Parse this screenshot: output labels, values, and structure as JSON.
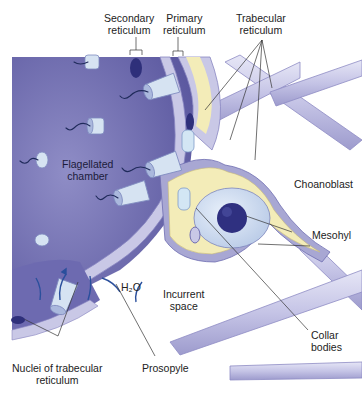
{
  "figure": {
    "colors": {
      "chamber": "#7b79b8",
      "chamber_dark": "#5e5ba3",
      "reticulum": "#c8c8e6",
      "reticulum_edge": "#a6a5d2",
      "mesohyl": "#f3ecb8",
      "nucleus": "#2e2f7a",
      "collar": "#cfe0f0",
      "flagellum": "#1f2a5a",
      "arrow": "#2a4f9c",
      "leader": "#333333"
    }
  },
  "labels": {
    "secondary_reticulum": [
      "Secondary",
      "reticulum"
    ],
    "primary_reticulum": [
      "Primary",
      "reticulum"
    ],
    "trabecular_reticulum": [
      "Trabecular",
      "reticulum"
    ],
    "flagellated_chamber": [
      "Flagellated",
      "chamber"
    ],
    "choanoblast": "Choanoblast",
    "mesohyl": "Mesohyl",
    "h2o": "H₂O",
    "incurrent_space": [
      "Incurrent",
      "space"
    ],
    "collar_bodies": [
      "Collar",
      "bodies"
    ],
    "nuclei_trabecular": [
      "Nuclei of trabecular",
      "reticulum"
    ],
    "prosopyle": "Prosopyle"
  }
}
